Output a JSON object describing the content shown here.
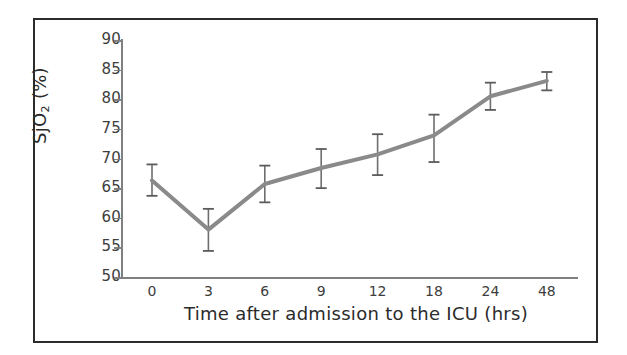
{
  "chart_data": {
    "type": "line",
    "title": "",
    "xlabel": "Time after admission to the ICU (hrs)",
    "ylabel": "SjO2 (%)",
    "ylabel_base": "SjO",
    "ylabel_sub": "2",
    "ylabel_unit": " (%)",
    "categories": [
      "0",
      "3",
      "6",
      "9",
      "12",
      "18",
      "24",
      "48"
    ],
    "values": [
      66.3,
      58.0,
      65.7,
      68.4,
      70.7,
      73.9,
      80.5,
      83.1
    ],
    "error_low": [
      63.7,
      54.4,
      62.6,
      65.0,
      67.2,
      69.4,
      78.2,
      81.5
    ],
    "error_high": [
      69.0,
      61.5,
      68.8,
      71.6,
      74.1,
      77.4,
      82.8,
      84.6
    ],
    "ylim": [
      50,
      90
    ],
    "ytick_labels": [
      "90",
      "85",
      "80",
      "75",
      "70",
      "65",
      "60",
      "55",
      "50"
    ],
    "yticks": [
      90,
      85,
      80,
      75,
      70,
      65,
      60,
      55,
      50
    ],
    "grid": false,
    "legend": "none",
    "line_color": "#8a8a8a",
    "errorbar_color": "#6e6e6e",
    "axis_color": "#808080",
    "text_color": "#2b2b2b",
    "frame_color": "#2b2b2b",
    "background": "#ffffff"
  }
}
